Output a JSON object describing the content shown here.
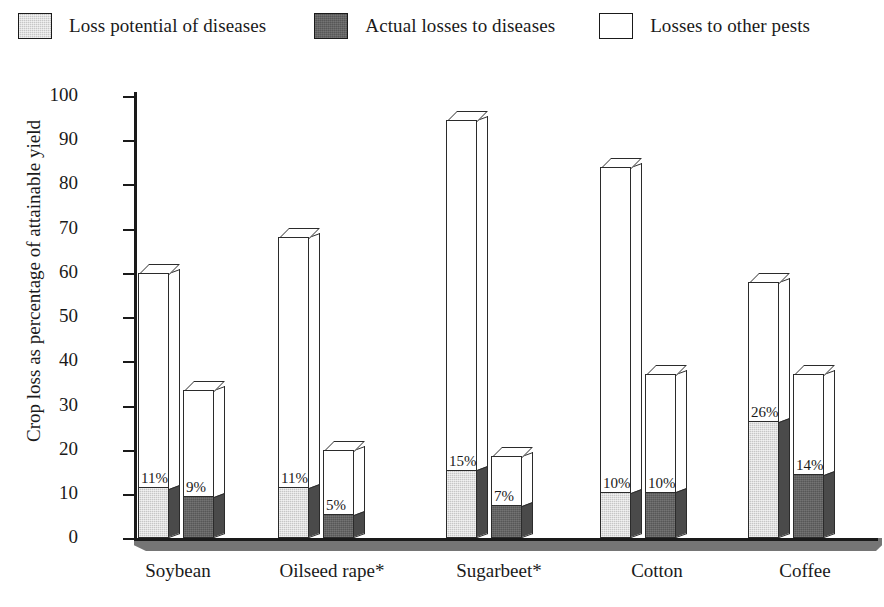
{
  "legend": {
    "items": [
      {
        "label": "Loss potential of diseases",
        "swatch": "light-gray",
        "color": "#c6c6c6"
      },
      {
        "label": "Actual losses to diseases",
        "swatch": "dark-gray",
        "color": "#575757"
      },
      {
        "label": "Losses to other pests",
        "swatch": "white",
        "color": "#ffffff"
      }
    ]
  },
  "axes": {
    "ylabel": "Crop loss as percentage of attainable yield",
    "yticks": [
      "100",
      "90",
      "80",
      "70",
      "60",
      "50",
      "40",
      "30",
      "20",
      "10",
      "0"
    ]
  },
  "chart_data": {
    "type": "bar",
    "title": "",
    "xlabel": "",
    "ylabel": "Crop loss as percentage of attainable yield",
    "ylim": [
      0,
      100
    ],
    "ytick_step": 10,
    "grid": false,
    "legend_position": "top",
    "categories": [
      "Soybean",
      "Oilseed rape*",
      "Sugarbeet*",
      "Cotton",
      "Coffee"
    ],
    "series": [
      {
        "name": "Loss potential of diseases",
        "color": "#c6c6c6",
        "values": [
          11,
          11,
          15,
          10,
          26
        ],
        "labels": [
          "11%",
          "11%",
          "15%",
          "10%",
          "26%"
        ],
        "totals_with_other_pests": [
          60,
          68,
          94.5,
          84,
          58
        ]
      },
      {
        "name": "Actual losses to diseases",
        "color": "#575757",
        "values": [
          9,
          5,
          7,
          10,
          14
        ],
        "labels": [
          "9%",
          "5%",
          "7%",
          "10%",
          "14%"
        ],
        "totals_with_other_pests": [
          33.5,
          20,
          18.5,
          37,
          37
        ]
      }
    ],
    "stack_top_series": {
      "name": "Losses to other pests",
      "color": "#ffffff"
    }
  }
}
